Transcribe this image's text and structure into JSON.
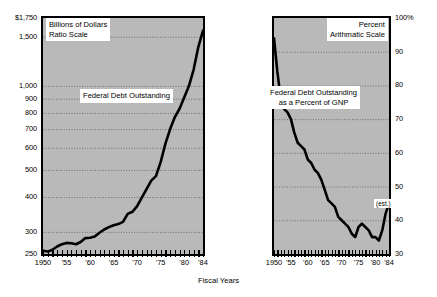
{
  "figure": {
    "x_axis_title": "Fiscal Years",
    "panels": [
      {
        "id": "federal-debt-outstanding",
        "box_title_line1": "Billions of Dollars",
        "box_title_line2": "Ratio Scale",
        "series_label": "Federal Debt Outstanding",
        "y_tick_labels": [
          "$1,750",
          "1,500",
          "1,000",
          "900",
          "800",
          "700",
          "600",
          "500",
          "400",
          "300",
          "250"
        ],
        "x_tick_labels": [
          "1950",
          "'55",
          "'60",
          "'65",
          "'70",
          "'75",
          "'80",
          "'84"
        ]
      },
      {
        "id": "federal-debt-percent-gnp",
        "box_title_line1": "Percent",
        "box_title_line2": "Arithmatic Scale",
        "series_label_line1": "Federal Debt Outstanding",
        "series_label_line2": "as a Percent of GNP",
        "estimate_note": "(est.)",
        "y_tick_labels": [
          "100%",
          "90",
          "80",
          "70",
          "60",
          "50",
          "40",
          "30"
        ],
        "x_tick_labels": [
          "1950",
          "'55",
          "'60",
          "'65",
          "'70",
          "'75",
          "'80",
          "'84"
        ]
      }
    ],
    "colors": {
      "panel_fill": "#b9b9b9",
      "frame": "#000000",
      "line": "#000000",
      "gridline": "#6e6e6e",
      "label_box": "#ffffff"
    }
  },
  "chart_data": [
    {
      "type": "line",
      "title": "Federal Debt Outstanding",
      "subtitle": "Billions of Dollars, Ratio Scale",
      "xlabel": "Fiscal Years",
      "ylabel": "Billions of Dollars",
      "scale": "log",
      "grid": true,
      "legend": "none",
      "xlim": [
        1950,
        1984
      ],
      "ylim": [
        250,
        1750
      ],
      "yticks": [
        250,
        300,
        400,
        500,
        600,
        700,
        800,
        900,
        1000,
        1500,
        1750
      ],
      "ytick_labels": [
        "250",
        "300",
        "400",
        "500",
        "600",
        "700",
        "800",
        "900",
        "1,000",
        "1,500",
        "$1,750"
      ],
      "xticks": [
        1950,
        1955,
        1960,
        1965,
        1970,
        1975,
        1980,
        1984
      ],
      "xtick_labels": [
        "1950",
        "'55",
        "'60",
        "'65",
        "'70",
        "'75",
        "'80",
        "'84"
      ],
      "x": [
        1950,
        1951,
        1952,
        1953,
        1954,
        1955,
        1956,
        1957,
        1958,
        1959,
        1960,
        1961,
        1962,
        1963,
        1964,
        1965,
        1966,
        1967,
        1968,
        1969,
        1970,
        1971,
        1972,
        1973,
        1974,
        1975,
        1976,
        1977,
        1978,
        1979,
        1980,
        1981,
        1982,
        1983,
        1984
      ],
      "values": [
        257,
        255,
        259,
        266,
        271,
        274,
        273,
        271,
        276,
        285,
        286,
        289,
        298,
        306,
        312,
        317,
        320,
        326,
        348,
        354,
        371,
        398,
        427,
        458,
        475,
        533,
        620,
        699,
        772,
        827,
        908,
        998,
        1142,
        1377,
        1577
      ],
      "units": "billions of dollars"
    },
    {
      "type": "line",
      "title": "Federal Debt Outstanding as a Percent of GNP",
      "subtitle": "Percent, Arithmatic Scale",
      "xlabel": "Fiscal Years",
      "ylabel": "Percent",
      "scale": "linear",
      "grid": true,
      "legend": "none",
      "xlim": [
        1950,
        1984
      ],
      "ylim": [
        30,
        100
      ],
      "yticks": [
        30,
        40,
        50,
        60,
        70,
        80,
        90,
        100
      ],
      "ytick_labels": [
        "30",
        "40",
        "50",
        "60",
        "70",
        "80",
        "90",
        "100%"
      ],
      "xticks": [
        1950,
        1955,
        1960,
        1965,
        1970,
        1975,
        1980,
        1984
      ],
      "xtick_labels": [
        "1950",
        "'55",
        "'60",
        "'65",
        "'70",
        "'75",
        "'80",
        "'84"
      ],
      "x": [
        1950,
        1951,
        1952,
        1953,
        1954,
        1955,
        1956,
        1957,
        1958,
        1959,
        1960,
        1961,
        1962,
        1963,
        1964,
        1965,
        1966,
        1967,
        1968,
        1969,
        1970,
        1971,
        1972,
        1973,
        1974,
        1975,
        1976,
        1977,
        1978,
        1979,
        1980,
        1981,
        1982,
        1983,
        1984
      ],
      "values": [
        94,
        84,
        76,
        73,
        72,
        70,
        66,
        63,
        62,
        61,
        58,
        57,
        55,
        54,
        52,
        49,
        46,
        45,
        44,
        41,
        40,
        39,
        38,
        36,
        35,
        38,
        39,
        38,
        37,
        35,
        35,
        34,
        37,
        42,
        45
      ],
      "annotations": [
        {
          "text": "(est.)",
          "x": 1984,
          "y": 45
        }
      ],
      "units": "percent of GNP"
    }
  ]
}
